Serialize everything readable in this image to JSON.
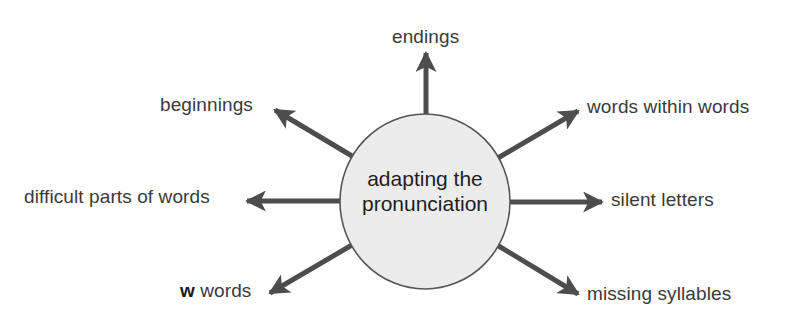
{
  "center": {
    "line1": "adapting the",
    "line2": "pronunciation",
    "fill": "#ececec",
    "stroke": "#555555"
  },
  "arrow_color": "#4d4d4d",
  "branches": [
    {
      "id": "endings",
      "label": "endings"
    },
    {
      "id": "beginnings",
      "label": "beginnings"
    },
    {
      "id": "words-within-words",
      "label": "words within words"
    },
    {
      "id": "difficult-parts",
      "label": "difficult parts of words"
    },
    {
      "id": "silent-letters",
      "label": "silent letters"
    },
    {
      "id": "w-words",
      "label_bold": "w",
      "label": " words"
    },
    {
      "id": "missing-syllables",
      "label": "missing syllables"
    }
  ]
}
